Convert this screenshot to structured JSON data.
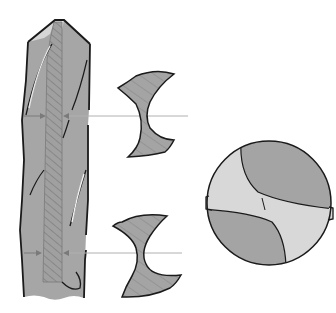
{
  "figure": {
    "subject": "Twist drill with web cross-sections and end view",
    "colors": {
      "background": "#ffffff",
      "body_fill": "#a6a6a6",
      "web_fill": "#9a9a9a",
      "hatch": "#7a7a7a",
      "highlight": "#d4d4d4",
      "outline": "#1a1a1a",
      "leader_line": "#b0b0b0"
    },
    "parts": [
      {
        "id": "drill-side-view",
        "label": "Drill side view"
      },
      {
        "id": "web-strip",
        "label": "Web (core) tapering toward shank"
      },
      {
        "id": "section-upper",
        "label": "Cross-section near point (thin web)"
      },
      {
        "id": "section-lower",
        "label": "Cross-section toward shank (thicker web)"
      },
      {
        "id": "end-view",
        "label": "Drill point end view"
      }
    ]
  }
}
